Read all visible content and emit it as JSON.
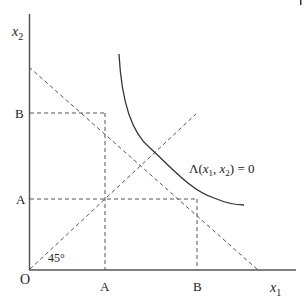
{
  "diagram": {
    "axes": {
      "y_label": "x",
      "y_label_sub": "2",
      "x_label": "x",
      "x_label_sub": "1",
      "origin_label": "O"
    },
    "ticks": {
      "y_B": "B",
      "y_A": "A",
      "x_A": "A",
      "x_B": "B"
    },
    "angle_label": "45°",
    "curve_label": {
      "lambda": "Λ(",
      "x1": "x",
      "sub1": "1",
      "comma": ", ",
      "x2": "x",
      "sub2": "2",
      "tail": ") = 0"
    },
    "colors": {
      "axis": "#555555",
      "curve": "#333333",
      "dashed": "#555555"
    }
  }
}
